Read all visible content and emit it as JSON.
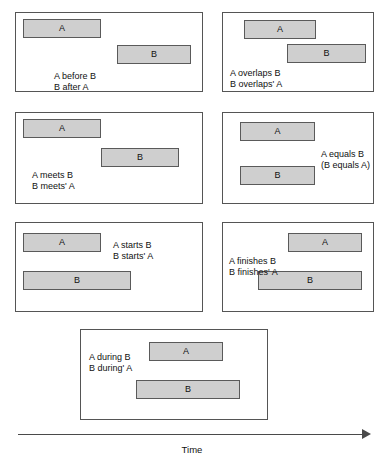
{
  "figure": {
    "axis": {
      "label": "Time",
      "direction": "left-to-right"
    }
  },
  "panels": [
    {
      "id": "before-after",
      "caption": [
        "A before B",
        "B after A"
      ],
      "bars": [
        {
          "label": "A",
          "x": 7,
          "y": 6,
          "w": 78,
          "h": 19
        },
        {
          "label": "B",
          "x": 101,
          "y": 32,
          "w": 74,
          "h": 19
        }
      ],
      "caption_x": 38,
      "caption_y": 58,
      "box": {
        "x": 15,
        "y": 12,
        "w": 188,
        "h": 80
      }
    },
    {
      "id": "overlaps",
      "caption": [
        "A overlaps B",
        "B overlaps' A"
      ],
      "bars": [
        {
          "label": "A",
          "x": 21,
          "y": 7,
          "w": 72,
          "h": 19
        },
        {
          "label": "B",
          "x": 64,
          "y": 31,
          "w": 79,
          "h": 19
        }
      ],
      "caption_x": 7,
      "caption_y": 55,
      "box": {
        "x": 222,
        "y": 12,
        "w": 152,
        "h": 80
      }
    },
    {
      "id": "meets",
      "caption": [
        "A meets B",
        "B meets' A"
      ],
      "bars": [
        {
          "label": "A",
          "x": 7,
          "y": 6,
          "w": 78,
          "h": 19
        },
        {
          "label": "B",
          "x": 85,
          "y": 35,
          "w": 78,
          "h": 19
        }
      ],
      "caption_x": 16,
      "caption_y": 57,
      "box": {
        "x": 15,
        "y": 112,
        "w": 188,
        "h": 92
      }
    },
    {
      "id": "equals",
      "caption": [
        "A equals B",
        "(B equals A)"
      ],
      "bars": [
        {
          "label": "A",
          "x": 17,
          "y": 9,
          "w": 75,
          "h": 19
        },
        {
          "label": "B",
          "x": 17,
          "y": 53,
          "w": 75,
          "h": 19
        }
      ],
      "caption_x": 98,
      "caption_y": 36,
      "box": {
        "x": 222,
        "y": 112,
        "w": 152,
        "h": 92
      }
    },
    {
      "id": "starts",
      "caption": [
        "A starts B",
        "B starts' A"
      ],
      "bars": [
        {
          "label": "A",
          "x": 7,
          "y": 10,
          "w": 78,
          "h": 19
        },
        {
          "label": "B",
          "x": 7,
          "y": 48,
          "w": 108,
          "h": 19
        }
      ],
      "caption_x": 97,
      "caption_y": 17,
      "box": {
        "x": 15,
        "y": 222,
        "w": 188,
        "h": 90
      }
    },
    {
      "id": "finishes",
      "caption": [
        "A finishes B",
        "B finishes' A"
      ],
      "bars": [
        {
          "label": "A",
          "x": 65,
          "y": 10,
          "w": 74,
          "h": 19
        },
        {
          "label": "B",
          "x": 35,
          "y": 48,
          "w": 104,
          "h": 19
        }
      ],
      "caption_x": 6,
      "caption_y": 33,
      "box": {
        "x": 222,
        "y": 222,
        "w": 152,
        "h": 90
      }
    },
    {
      "id": "during",
      "caption": [
        "A during B",
        "B during' A"
      ],
      "bars": [
        {
          "label": "A",
          "x": 68,
          "y": 12,
          "w": 74,
          "h": 19
        },
        {
          "label": "B",
          "x": 55,
          "y": 50,
          "w": 104,
          "h": 19
        }
      ],
      "caption_x": 8,
      "caption_y": 22,
      "box": {
        "x": 80,
        "y": 329,
        "w": 188,
        "h": 91
      }
    }
  ]
}
